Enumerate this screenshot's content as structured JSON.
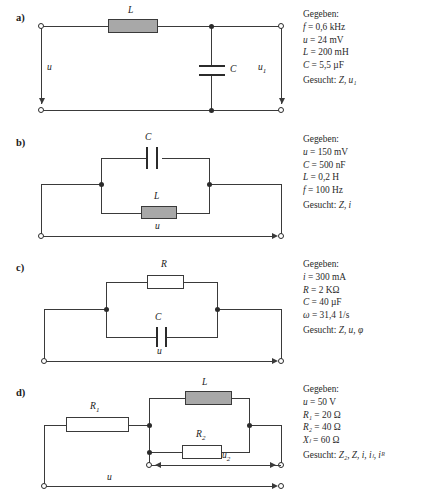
{
  "problems": [
    {
      "label": "a)",
      "components": {
        "inductor": "L",
        "capacitor": "C"
      },
      "voltages": {
        "left": "u",
        "right": "u",
        "right_sub": "1"
      },
      "panel": {
        "heading": "Gegeben:",
        "given": [
          {
            "sym": "f",
            "rest": "= 0,6 kHz"
          },
          {
            "sym": "u",
            "rest": "= 24 mV"
          },
          {
            "sym": "L",
            "rest": "= 200 mH"
          },
          {
            "sym": "C",
            "rest": "= 5,5 µF"
          }
        ],
        "sought_label": "Gesucht:",
        "sought": "Z, u₁"
      }
    },
    {
      "label": "b)",
      "components": {
        "capacitor": "C",
        "inductor": "L"
      },
      "voltages": {
        "bottom": "u"
      },
      "panel": {
        "heading": "Gegeben:",
        "given": [
          {
            "sym": "u",
            "rest": "= 150 mV"
          },
          {
            "sym": "C",
            "rest": "= 500 nF"
          },
          {
            "sym": "L",
            "rest": "= 0,2 H"
          },
          {
            "sym": "f",
            "rest": "= 100 Hz"
          }
        ],
        "sought_label": "Gesucht:",
        "sought": "Z, i"
      }
    },
    {
      "label": "c)",
      "components": {
        "resistor": "R",
        "capacitor": "C"
      },
      "voltages": {
        "bottom": "u"
      },
      "panel": {
        "heading": "Gegeben:",
        "given": [
          {
            "sym": "i",
            "rest": "= 300 mA"
          },
          {
            "sym": "R",
            "rest": "= 2 KΩ"
          },
          {
            "sym": "C",
            "rest": "= 40 µF"
          },
          {
            "sym": "ω",
            "rest": "= 31,4 1/s"
          }
        ],
        "sought_label": "Gesucht:",
        "sought": "Z, u, φ"
      }
    },
    {
      "label": "d)",
      "components": {
        "resistor1": "R",
        "resistor1_sub": "1",
        "inductor": "L",
        "resistor2": "R",
        "resistor2_sub": "2"
      },
      "voltages": {
        "bottom": "u",
        "middle": "u",
        "middle_sub": "2"
      },
      "panel": {
        "heading": "Gegeben:",
        "given": [
          {
            "sym": "u",
            "rest": "= 50 V"
          },
          {
            "sym": "R₁",
            "rest": "= 20 Ω"
          },
          {
            "sym": "R₂",
            "rest": "= 40 Ω"
          },
          {
            "sym": "Xₗ",
            "rest": "= 60 Ω"
          }
        ],
        "sought_label": "Gesucht:",
        "sought": "Z₂, Z, i, iₗ, iᴿ"
      }
    }
  ],
  "colors": {
    "wire": "#3a3a3a",
    "inductor_fill": "#a8a8a8",
    "resistor_fill": "#ffffff",
    "text": "#1a1a1a"
  }
}
